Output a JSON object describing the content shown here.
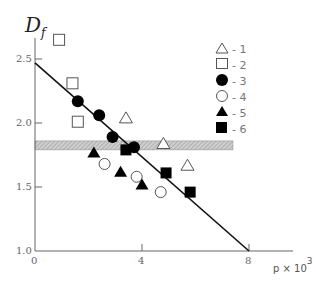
{
  "chart_data": {
    "type": "scatter",
    "title": "",
    "ylabel": "D_f",
    "xlabel": "p × 10^3",
    "xlim": [
      0,
      9
    ],
    "ylim": [
      1.0,
      2.75
    ],
    "xticks": [
      0,
      4,
      8
    ],
    "yticks": [
      1.0,
      1.5,
      2.0,
      2.5
    ],
    "xtick_labels": [
      "0",
      "4",
      "8"
    ],
    "ytick_labels": [
      "1.0",
      "1.5",
      "2.0",
      "2.5"
    ],
    "grid": false,
    "legend_position": "upper right",
    "shaded_band": {
      "y_min": 1.79,
      "y_max": 1.86,
      "x_min": 0,
      "x_max": 7.4,
      "style": "hatched gray"
    },
    "fit_line": {
      "x": [
        0,
        8
      ],
      "y": [
        2.47,
        1.0
      ]
    },
    "series": [
      {
        "name": "1",
        "marker": "open-triangle",
        "points": [
          [
            3.4,
            2.04
          ],
          [
            4.8,
            1.84
          ],
          [
            5.7,
            1.67
          ]
        ]
      },
      {
        "name": "2",
        "marker": "open-square",
        "points": [
          [
            0.9,
            2.65
          ],
          [
            1.4,
            2.31
          ],
          [
            1.6,
            2.01
          ]
        ]
      },
      {
        "name": "3",
        "marker": "filled-circle",
        "points": [
          [
            1.6,
            2.17
          ],
          [
            2.4,
            2.06
          ],
          [
            2.9,
            1.89
          ],
          [
            3.7,
            1.81
          ]
        ]
      },
      {
        "name": "4",
        "marker": "open-circle",
        "points": [
          [
            2.6,
            1.68
          ],
          [
            3.8,
            1.58
          ],
          [
            4.7,
            1.46
          ]
        ]
      },
      {
        "name": "5",
        "marker": "filled-triangle",
        "points": [
          [
            2.2,
            1.77
          ],
          [
            3.2,
            1.62
          ],
          [
            4.0,
            1.52
          ]
        ]
      },
      {
        "name": "6",
        "marker": "filled-square",
        "points": [
          [
            3.4,
            1.79
          ],
          [
            4.9,
            1.61
          ],
          [
            5.8,
            1.46
          ]
        ]
      }
    ]
  },
  "labels": {
    "y_axis_main": "D",
    "y_axis_sub": "f",
    "x_axis_main": "p × 10",
    "x_axis_sup": "3",
    "legend": [
      "- 1",
      "- 2",
      "- 3",
      "- 4",
      "- 5",
      "- 6"
    ],
    "xticks": [
      "0",
      "4",
      "8"
    ],
    "yticks": [
      "1.0",
      "1.5",
      "2.0",
      "2.5"
    ]
  }
}
